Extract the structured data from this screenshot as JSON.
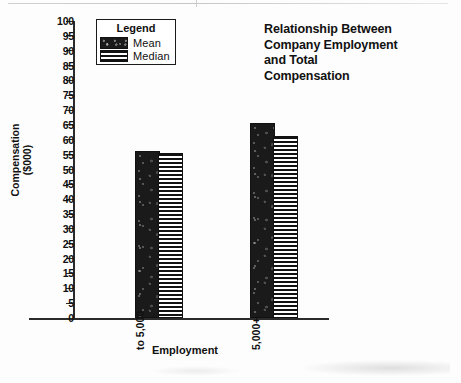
{
  "chart_data": {
    "type": "bar",
    "title_lines": [
      "Relationship Between",
      "Company Employment",
      "and Total",
      "Compensation"
    ],
    "xlabel": "Employment",
    "ylabel": "Compensation ($000)",
    "ylabel_lines": [
      "Compensation",
      "($000)"
    ],
    "categories": [
      "to 5,000",
      "5,000+"
    ],
    "series": [
      {
        "name": "Mean",
        "values": [
          55.5,
          65.0
        ],
        "fill": "speckled-black",
        "color": "#1a1a1a"
      },
      {
        "name": "Median",
        "values": [
          55.0,
          60.5
        ],
        "fill": "horizontal-stripes",
        "color": "#121212"
      }
    ],
    "ylim": [
      0,
      100
    ],
    "ytick_step": 5,
    "yticks": [
      0,
      5,
      10,
      15,
      20,
      25,
      30,
      35,
      40,
      45,
      50,
      55,
      60,
      65,
      70,
      75,
      80,
      85,
      90,
      95,
      100
    ],
    "grid": false,
    "legend": {
      "title": "Legend",
      "position": "top-left-inside",
      "entries": [
        "Mean",
        "Median"
      ]
    }
  },
  "legend": {
    "title": "Legend",
    "mean_label": "Mean",
    "median_label": "Median"
  },
  "axes": {
    "y_title_line1": "Compensation",
    "y_title_line2": "($000)",
    "x_title": "Employment",
    "category_1": "to 5,000",
    "category_2": "5,000+"
  },
  "colors": {
    "ink": "#111111",
    "bar_mean": "#1a1a1a",
    "bar_median_stripe": "#121212",
    "background": "#fdfdfd"
  }
}
